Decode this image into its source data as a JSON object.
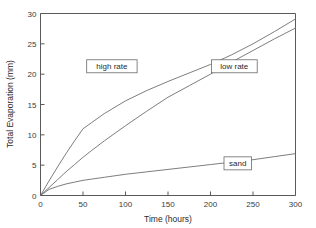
{
  "chart_data": {
    "type": "line",
    "title": "",
    "xlabel": "Time (hours)",
    "ylabel": "Total Evaporation (mm)",
    "xlim": [
      0,
      300
    ],
    "ylim": [
      0,
      30
    ],
    "xticks": [
      0,
      50,
      100,
      150,
      200,
      250,
      300
    ],
    "yticks": [
      0,
      5,
      10,
      15,
      20,
      25,
      30
    ],
    "xtick_labels": [
      "0",
      "50",
      "100",
      "150",
      "200",
      "250",
      "300"
    ],
    "ytick_labels": [
      "0",
      "5",
      "10",
      "15",
      "20",
      "25",
      "30"
    ],
    "grid": false,
    "legend_position": "inline-annotations",
    "line_color": "#6e6e6e",
    "axis_color": "#5a5a5a",
    "background_color": "#ffffff",
    "x": [
      0,
      10,
      20,
      30,
      40,
      50,
      60,
      75,
      100,
      125,
      150,
      175,
      200,
      225,
      250,
      275,
      300
    ],
    "series": [
      {
        "name": "high rate",
        "label": "high rate",
        "values": [
          0,
          2.4,
          4.7,
          6.9,
          9.0,
          11.0,
          12.0,
          13.5,
          15.6,
          17.3,
          18.8,
          20.2,
          21.6,
          23.2,
          25.0,
          27.0,
          29.1
        ]
      },
      {
        "name": "low rate",
        "label": "low rate",
        "values": [
          0,
          1.3,
          2.6,
          3.9,
          5.1,
          6.3,
          7.4,
          9.0,
          11.5,
          13.9,
          16.2,
          18.1,
          20.0,
          22.0,
          23.9,
          25.8,
          27.6
        ]
      },
      {
        "name": "sand",
        "label": "sand",
        "values": [
          0,
          1.0,
          1.5,
          1.9,
          2.2,
          2.5,
          2.7,
          3.0,
          3.5,
          3.9,
          4.3,
          4.7,
          5.1,
          5.5,
          5.9,
          6.4,
          6.9
        ]
      }
    ],
    "annotations": [
      {
        "text": "high rate",
        "x_hours": 84,
        "y_mm": 21.3
      },
      {
        "text": "low rate",
        "x_hours": 228,
        "y_mm": 21.3
      },
      {
        "text": "sand",
        "x_hours": 232,
        "y_mm": 5.3
      }
    ]
  }
}
